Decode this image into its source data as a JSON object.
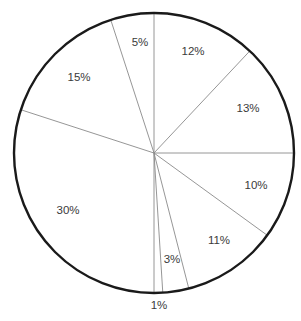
{
  "chart_data": {
    "type": "pie",
    "title": "",
    "start_angle_deg": 0,
    "direction": "clockwise",
    "center": [
      154,
      153
    ],
    "radius": 140,
    "colors": {
      "fill": "#ffffff",
      "outline": "#1a1a1a",
      "dividers": "#8a8a8a",
      "label_text": "#3a3a3a"
    },
    "slices": [
      {
        "label": "12%",
        "value": 12,
        "label_pos": [
          193,
          52
        ]
      },
      {
        "label": "13%",
        "value": 13,
        "label_pos": [
          248,
          109
        ]
      },
      {
        "label": "10%",
        "value": 10,
        "label_pos": [
          256,
          186
        ]
      },
      {
        "label": "11%",
        "value": 11,
        "label_pos": [
          219,
          241
        ]
      },
      {
        "label": "3%",
        "value": 3,
        "label_pos": [
          172,
          260
        ]
      },
      {
        "label": "1%",
        "value": 1,
        "label_pos": [
          159,
          306
        ]
      },
      {
        "label": "30%",
        "value": 30,
        "label_pos": [
          68,
          211
        ]
      },
      {
        "label": "15%",
        "value": 15,
        "label_pos": [
          79,
          78
        ]
      },
      {
        "label": "5%",
        "value": 5,
        "label_pos": [
          140,
          43
        ]
      }
    ],
    "legend": null
  }
}
